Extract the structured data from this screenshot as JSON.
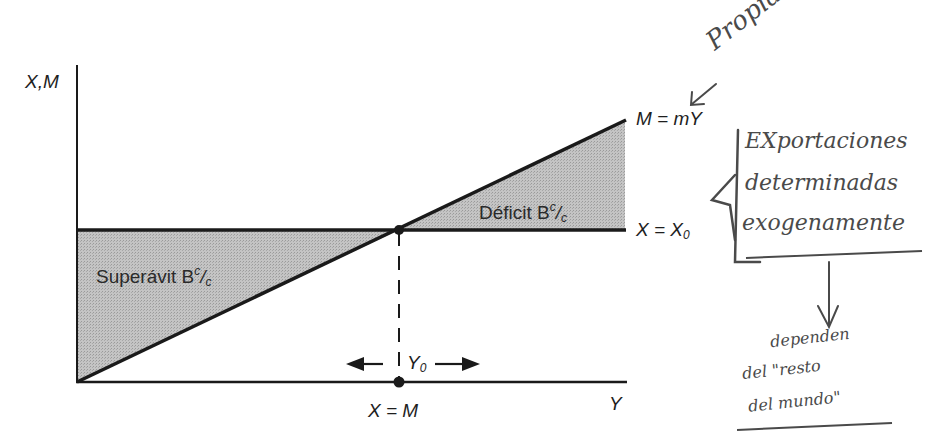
{
  "diagram": {
    "type": "economics-trade-balance",
    "colors": {
      "line": "#1a1a1a",
      "shade": "#bdbdbd",
      "handwriting": "#4a4a4a",
      "background": "#ffffff"
    },
    "axes": {
      "y_label": "X,M",
      "x_label": "Y"
    },
    "lines": {
      "imports": {
        "label": "M = mY"
      },
      "exports": {
        "label": "X = X",
        "subscript": "0"
      }
    },
    "regions": {
      "deficit": {
        "label": "Déficit B",
        "sup": "c",
        "frac": "/",
        "sub": "c"
      },
      "surplus": {
        "label": "Superávit B",
        "sup": "c",
        "frac": "/",
        "sub": "c"
      }
    },
    "equilibrium": {
      "income_label": "Y",
      "income_subscript": "0",
      "condition_label": "X = M"
    }
  },
  "annotations": {
    "top": "Propia a Ex",
    "box_lines": [
      "EXportaciones",
      "determinadas",
      "exogenamente"
    ],
    "bottom_lines": [
      "dependen",
      "del \"resto",
      "del mundo\""
    ]
  }
}
